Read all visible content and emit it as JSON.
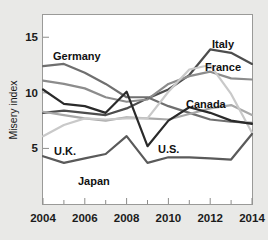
{
  "chart_data": {
    "type": "line",
    "title": "",
    "subtitle": "",
    "xlabel": "",
    "ylabel": "Misery index",
    "xlim": [
      2004,
      2014
    ],
    "ylim": [
      0,
      17
    ],
    "grid": false,
    "legend_position": "inline-labels",
    "x": [
      2004,
      2005,
      2006,
      2007,
      2008,
      2009,
      2010,
      2011,
      2012,
      2013,
      2014
    ],
    "x_tick_labels": [
      "2004",
      "2006",
      "2008",
      "2010",
      "2012",
      "2014"
    ],
    "x_major_ticks": [
      2004,
      2006,
      2008,
      2010,
      2012,
      2014
    ],
    "x_minor_ticks": [
      2005,
      2007,
      2009,
      2011,
      2013
    ],
    "y_tick_labels": [
      "5",
      "10",
      "15"
    ],
    "y_ticks": [
      5,
      10,
      15
    ],
    "series": [
      {
        "name": "Italy",
        "color": "#4d4d4d",
        "width": 2.2,
        "values": [
          8.2,
          8.4,
          8.2,
          8.0,
          8.6,
          9.5,
          10.3,
          11.6,
          13.9,
          13.6,
          12.6
        ]
      },
      {
        "name": "France",
        "color": "#8c8c8c",
        "width": 2.2,
        "values": [
          11.1,
          10.8,
          10.4,
          9.6,
          9.2,
          9.4,
          10.8,
          11.5,
          11.9,
          11.3,
          11.2
        ]
      },
      {
        "name": "Germany",
        "color": "#6f6f6f",
        "width": 2.2,
        "values": [
          12.4,
          12.6,
          11.8,
          10.8,
          9.6,
          9.6,
          8.8,
          8.2,
          7.6,
          7.4,
          7.3
        ]
      },
      {
        "name": "Canada",
        "color": "#a8a8a8",
        "width": 2.2,
        "values": [
          8.3,
          8.0,
          7.7,
          7.5,
          7.8,
          7.7,
          7.6,
          8.1,
          8.6,
          8.9,
          8.0
        ]
      },
      {
        "name": "U.K.",
        "color": "#c9c9c9",
        "width": 2.2,
        "values": [
          6.1,
          7.1,
          7.7,
          7.6,
          7.7,
          7.7,
          10.1,
          12.1,
          12.5,
          9.9,
          6.4
        ]
      },
      {
        "name": "U.S.",
        "color": "#2a2a2a",
        "width": 2.2,
        "values": [
          10.3,
          9.0,
          8.8,
          8.2,
          10.1,
          5.2,
          7.5,
          8.7,
          8.2,
          7.5,
          7.2
        ]
      },
      {
        "name": "Japan",
        "color": "#5a5a5a",
        "width": 2.2,
        "values": [
          4.3,
          3.7,
          4.1,
          4.5,
          6.1,
          3.7,
          4.2,
          4.2,
          4.1,
          4.0,
          6.3
        ]
      }
    ],
    "annotations": [
      {
        "label": "Germany",
        "x": 53,
        "y": 60
      },
      {
        "label": "Italy",
        "x": 212,
        "y": 48
      },
      {
        "label": "France",
        "x": 205,
        "y": 71
      },
      {
        "label": "Canada",
        "x": 186,
        "y": 108
      },
      {
        "label": "U.K.",
        "x": 54,
        "y": 155
      },
      {
        "label": "U.S.",
        "x": 158,
        "y": 153
      },
      {
        "label": "Japan",
        "x": 78,
        "y": 185
      }
    ]
  }
}
